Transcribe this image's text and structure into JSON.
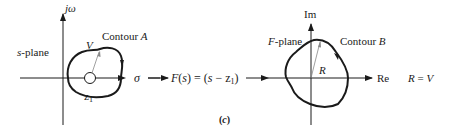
{
  "figure": {
    "panel_label": "(c)",
    "left_plane": {
      "plane_label": "s-plane",
      "vertical_axis_label": "jω",
      "horizontal_axis_label": "σ",
      "contour_label": "Contour A",
      "radius_label": "V",
      "zero_label": "z1"
    },
    "mapping": {
      "function_label": "F(s) = (s − z1)"
    },
    "right_plane": {
      "plane_label": "F-plane",
      "vertical_axis_label": "Im",
      "horizontal_axis_label": "Re",
      "contour_label": "Contour B",
      "radius_label": "R"
    },
    "relation": "R = V"
  },
  "colors": {
    "ink": "#1a1a1a",
    "radius_line": "#888888",
    "background": "#ffffff"
  }
}
